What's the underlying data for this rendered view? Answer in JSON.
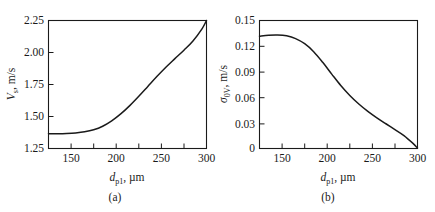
{
  "figure": {
    "panels": [
      {
        "id": "a",
        "caption": "(a)",
        "ylabel_main": "V",
        "ylabel_sub": "s",
        "ylabel_tail": ", m/s",
        "xlabel_main": "d",
        "xlabel_sub": "p1",
        "xlabel_tail": ", µm",
        "yticks": [
          "1.25",
          "1.50",
          "1.75",
          "2.00",
          "2.25"
        ],
        "xticks": [
          "150",
          "200",
          "250",
          "300"
        ]
      },
      {
        "id": "b",
        "caption": "(b)",
        "ylabel_main": "σ",
        "ylabel_sub": "0V",
        "ylabel_tail": ", m/s",
        "xlabel_main": "d",
        "xlabel_sub": "p1",
        "xlabel_tail": ", µm",
        "yticks": [
          "0",
          "0.03",
          "0.06",
          "0.09",
          "0.12",
          "0.15"
        ],
        "xticks": [
          "150",
          "200",
          "250",
          "300"
        ]
      }
    ]
  },
  "chart_data": [
    {
      "type": "line",
      "panel": "a",
      "title": "",
      "xlabel": "d_p1, µm",
      "ylabel": "V_s, m/s",
      "xlim": [
        125,
        300
      ],
      "ylim": [
        1.25,
        2.25
      ],
      "xticks": [
        150,
        175,
        200,
        225,
        250,
        275,
        300
      ],
      "xticklabels": [
        "150",
        "",
        "200",
        "",
        "250",
        "",
        "300"
      ],
      "yticks": [
        1.25,
        1.5,
        1.75,
        2.0,
        2.25
      ],
      "yticklabels": [
        "1.25",
        "1.50",
        "1.75",
        "2.00",
        "2.25"
      ],
      "grid": false,
      "legend": null,
      "x": [
        125,
        135,
        145,
        155,
        165,
        175,
        185,
        195,
        205,
        215,
        225,
        235,
        245,
        255,
        265,
        275,
        285,
        295,
        300
      ],
      "y": [
        1.365,
        1.366,
        1.368,
        1.372,
        1.38,
        1.396,
        1.424,
        1.466,
        1.52,
        1.585,
        1.658,
        1.735,
        1.812,
        1.885,
        1.952,
        2.018,
        2.09,
        2.185,
        2.25
      ],
      "series": [
        {
          "name": "V_s",
          "values": [
            1.365,
            1.366,
            1.368,
            1.372,
            1.38,
            1.396,
            1.424,
            1.466,
            1.52,
            1.585,
            1.658,
            1.735,
            1.812,
            1.885,
            1.952,
            2.018,
            2.09,
            2.185,
            2.25
          ]
        }
      ]
    },
    {
      "type": "line",
      "panel": "b",
      "title": "",
      "xlabel": "d_p1, µm",
      "ylabel": "σ_0V, m/s",
      "xlim": [
        125,
        300
      ],
      "ylim": [
        0,
        0.15
      ],
      "xticks": [
        150,
        175,
        200,
        225,
        250,
        275,
        300
      ],
      "xticklabels": [
        "150",
        "",
        "200",
        "",
        "250",
        "",
        "300"
      ],
      "yticks": [
        0,
        0.03,
        0.06,
        0.09,
        0.12,
        0.15
      ],
      "yticklabels": [
        "0",
        "0.03",
        "0.06",
        "0.09",
        "0.12",
        "0.15"
      ],
      "grid": false,
      "legend": null,
      "x": [
        125,
        135,
        145,
        155,
        165,
        175,
        185,
        195,
        205,
        215,
        225,
        235,
        245,
        255,
        265,
        275,
        285,
        295,
        300
      ],
      "y": [
        0.1315,
        0.1327,
        0.133,
        0.132,
        0.1288,
        0.1228,
        0.1135,
        0.101,
        0.0872,
        0.0738,
        0.0622,
        0.0522,
        0.0436,
        0.036,
        0.029,
        0.0222,
        0.0152,
        0.006,
        0.0005
      ],
      "series": [
        {
          "name": "sigma_0V",
          "values": [
            0.1315,
            0.1327,
            0.133,
            0.132,
            0.1288,
            0.1228,
            0.1135,
            0.101,
            0.0872,
            0.0738,
            0.0622,
            0.0522,
            0.0436,
            0.036,
            0.029,
            0.0222,
            0.0152,
            0.006,
            0.0005
          ]
        }
      ]
    }
  ]
}
